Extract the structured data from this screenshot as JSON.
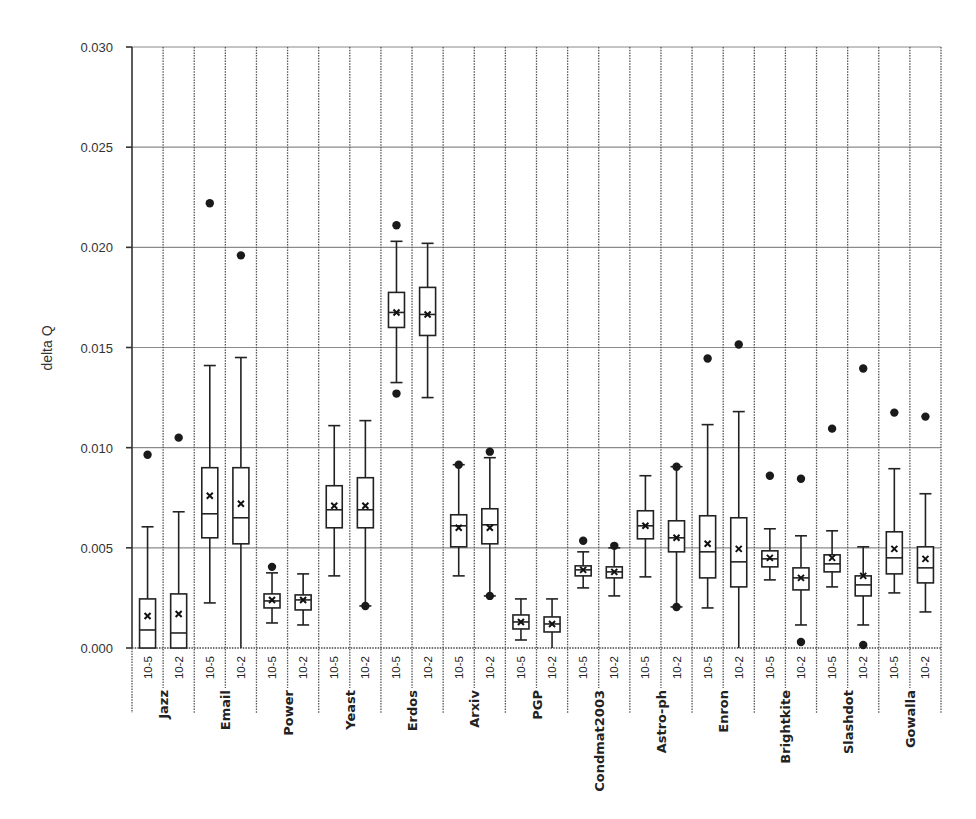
{
  "chart_data": {
    "type": "boxplot",
    "title": "",
    "xlabel": "",
    "ylabel": "delta Q",
    "ylim": [
      0.0,
      0.03
    ],
    "yticks": [
      "0.000",
      "0.005",
      "0.010",
      "0.015",
      "0.020",
      "0.025",
      "0.030"
    ],
    "ytick_values": [
      0.0,
      0.005,
      0.01,
      0.015,
      0.02,
      0.025,
      0.03
    ],
    "grid": {
      "horizontal": true,
      "vertical": "dotted-separators"
    },
    "legend": null,
    "sub_categories": [
      "10-5",
      "10-2"
    ],
    "groups": [
      {
        "name": "Jazz",
        "boxes": [
          {
            "sub": "10-5",
            "whisker_low": 0.0,
            "q1": 0.0,
            "median": 0.0009,
            "mean": 0.0016,
            "q3": 0.00245,
            "whisker_high": 0.00605,
            "outliers": [
              0.00965
            ]
          },
          {
            "sub": "10-2",
            "whisker_low": 0.0,
            "q1": 0.0,
            "median": 0.00075,
            "mean": 0.0017,
            "q3": 0.0027,
            "whisker_high": 0.0068,
            "outliers": [
              0.0105
            ]
          }
        ]
      },
      {
        "name": "Email",
        "boxes": [
          {
            "sub": "10-5",
            "whisker_low": 0.00225,
            "q1": 0.0055,
            "median": 0.0067,
            "mean": 0.0076,
            "q3": 0.009,
            "whisker_high": 0.0141,
            "outliers": [
              0.0222
            ]
          },
          {
            "sub": "10-2",
            "whisker_low": 0.0,
            "q1": 0.0052,
            "median": 0.0065,
            "mean": 0.0072,
            "q3": 0.009,
            "whisker_high": 0.0145,
            "outliers": [
              0.0196
            ]
          }
        ]
      },
      {
        "name": "Power",
        "boxes": [
          {
            "sub": "10-5",
            "whisker_low": 0.00125,
            "q1": 0.002,
            "median": 0.00235,
            "mean": 0.0024,
            "q3": 0.0027,
            "whisker_high": 0.00375,
            "outliers": [
              0.00405
            ]
          },
          {
            "sub": "10-2",
            "whisker_low": 0.00115,
            "q1": 0.0019,
            "median": 0.0024,
            "mean": 0.0024,
            "q3": 0.00265,
            "whisker_high": 0.0037,
            "outliers": []
          }
        ]
      },
      {
        "name": "Yeast",
        "boxes": [
          {
            "sub": "10-5",
            "whisker_low": 0.0036,
            "q1": 0.006,
            "median": 0.0069,
            "mean": 0.0071,
            "q3": 0.0081,
            "whisker_high": 0.0111,
            "outliers": []
          },
          {
            "sub": "10-2",
            "whisker_low": 0.0021,
            "q1": 0.006,
            "median": 0.0069,
            "mean": 0.0071,
            "q3": 0.0085,
            "whisker_high": 0.01135,
            "outliers": [
              0.0021
            ]
          }
        ]
      },
      {
        "name": "Erdos",
        "boxes": [
          {
            "sub": "10-5",
            "whisker_low": 0.01325,
            "q1": 0.016,
            "median": 0.01675,
            "mean": 0.01675,
            "q3": 0.01775,
            "whisker_high": 0.0203,
            "outliers": [
              0.0211,
              0.0127
            ]
          },
          {
            "sub": "10-2",
            "whisker_low": 0.0125,
            "q1": 0.0156,
            "median": 0.01665,
            "mean": 0.01665,
            "q3": 0.018,
            "whisker_high": 0.0202,
            "outliers": []
          }
        ]
      },
      {
        "name": "Arxiv",
        "boxes": [
          {
            "sub": "10-5",
            "whisker_low": 0.0036,
            "q1": 0.00505,
            "median": 0.0061,
            "mean": 0.006,
            "q3": 0.00665,
            "whisker_high": 0.00915,
            "outliers": [
              0.00915
            ]
          },
          {
            "sub": "10-2",
            "whisker_low": 0.0026,
            "q1": 0.0052,
            "median": 0.00615,
            "mean": 0.006,
            "q3": 0.00695,
            "whisker_high": 0.0095,
            "outliers": [
              0.0098,
              0.0026
            ]
          }
        ]
      },
      {
        "name": "PGP",
        "boxes": [
          {
            "sub": "10-5",
            "whisker_low": 0.0004,
            "q1": 0.00095,
            "median": 0.0013,
            "mean": 0.0013,
            "q3": 0.00165,
            "whisker_high": 0.00245,
            "outliers": []
          },
          {
            "sub": "10-2",
            "whisker_low": 0.0,
            "q1": 0.0008,
            "median": 0.0012,
            "mean": 0.0012,
            "q3": 0.00155,
            "whisker_high": 0.00245,
            "outliers": []
          }
        ]
      },
      {
        "name": "Condmat2003",
        "boxes": [
          {
            "sub": "10-5",
            "whisker_low": 0.003,
            "q1": 0.0036,
            "median": 0.0039,
            "mean": 0.0039,
            "q3": 0.0041,
            "whisker_high": 0.0048,
            "outliers": [
              0.00535
            ]
          },
          {
            "sub": "10-2",
            "whisker_low": 0.0026,
            "q1": 0.0035,
            "median": 0.0038,
            "mean": 0.0038,
            "q3": 0.00405,
            "whisker_high": 0.005,
            "outliers": [
              0.0051
            ]
          }
        ]
      },
      {
        "name": "Astro-ph",
        "boxes": [
          {
            "sub": "10-5",
            "whisker_low": 0.00355,
            "q1": 0.00545,
            "median": 0.0061,
            "mean": 0.0061,
            "q3": 0.00685,
            "whisker_high": 0.0086,
            "outliers": []
          },
          {
            "sub": "10-2",
            "whisker_low": 0.00205,
            "q1": 0.0048,
            "median": 0.0055,
            "mean": 0.0055,
            "q3": 0.00635,
            "whisker_high": 0.00905,
            "outliers": [
              0.00905,
              0.00205
            ]
          }
        ]
      },
      {
        "name": "Enron",
        "boxes": [
          {
            "sub": "10-5",
            "whisker_low": 0.002,
            "q1": 0.0035,
            "median": 0.0048,
            "mean": 0.0052,
            "q3": 0.0066,
            "whisker_high": 0.01115,
            "outliers": [
              0.01445
            ]
          },
          {
            "sub": "10-2",
            "whisker_low": 0.0,
            "q1": 0.00305,
            "median": 0.0043,
            "mean": 0.00495,
            "q3": 0.0065,
            "whisker_high": 0.0118,
            "outliers": [
              0.01515
            ]
          }
        ]
      },
      {
        "name": "Brightkite",
        "boxes": [
          {
            "sub": "10-5",
            "whisker_low": 0.0034,
            "q1": 0.00405,
            "median": 0.00445,
            "mean": 0.0045,
            "q3": 0.00485,
            "whisker_high": 0.00595,
            "outliers": [
              0.0086
            ]
          },
          {
            "sub": "10-2",
            "whisker_low": 0.00115,
            "q1": 0.0029,
            "median": 0.0035,
            "mean": 0.0035,
            "q3": 0.004,
            "whisker_high": 0.0056,
            "outliers": [
              0.00845,
              0.0003
            ]
          }
        ]
      },
      {
        "name": "Slashdot",
        "boxes": [
          {
            "sub": "10-5",
            "whisker_low": 0.00305,
            "q1": 0.0038,
            "median": 0.0042,
            "mean": 0.0045,
            "q3": 0.00465,
            "whisker_high": 0.00585,
            "outliers": [
              0.01095
            ]
          },
          {
            "sub": "10-2",
            "whisker_low": 0.00115,
            "q1": 0.0026,
            "median": 0.00315,
            "mean": 0.0036,
            "q3": 0.0036,
            "whisker_high": 0.00505,
            "outliers": [
              0.01395,
              0.00015
            ]
          }
        ]
      },
      {
        "name": "Gowalla",
        "boxes": [
          {
            "sub": "10-5",
            "whisker_low": 0.00275,
            "q1": 0.0037,
            "median": 0.0045,
            "mean": 0.00495,
            "q3": 0.0058,
            "whisker_high": 0.00895,
            "outliers": [
              0.01175
            ]
          },
          {
            "sub": "10-2",
            "whisker_low": 0.0018,
            "q1": 0.00325,
            "median": 0.004,
            "mean": 0.00445,
            "q3": 0.00505,
            "whisker_high": 0.0077,
            "outliers": [
              0.01155
            ]
          }
        ]
      }
    ]
  },
  "layout": {
    "plot_left": 132,
    "plot_right": 941,
    "plot_top": 47,
    "plot_bottom": 648,
    "colors": {
      "box": "#222222",
      "outlier": "#1a1a1a",
      "grid": "#8a8a8a",
      "text": "#333333"
    }
  }
}
